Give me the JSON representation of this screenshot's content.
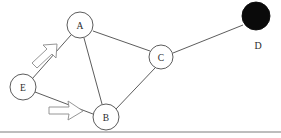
{
  "diagram": {
    "width": 281,
    "height": 138,
    "background_color": "#ffffff",
    "stroke_color": "#4a4a4a",
    "filled_node_color": "#0a0a0a",
    "arrow_outline_color": "#8a8a8a",
    "frame_color": "#6e6e6e"
  },
  "nodes": [
    {
      "id": "A",
      "label": "A",
      "cx": 80,
      "cy": 25,
      "r": 13,
      "style": "open",
      "label_inside": true
    },
    {
      "id": "B",
      "label": "B",
      "cx": 106,
      "cy": 117,
      "r": 13,
      "style": "open",
      "label_inside": true
    },
    {
      "id": "C",
      "label": "C",
      "cx": 161,
      "cy": 57,
      "r": 12,
      "style": "open",
      "label_inside": true
    },
    {
      "id": "D",
      "label": "D",
      "cx": 256,
      "cy": 16,
      "r": 14,
      "style": "filled",
      "label_inside": false,
      "label_x": 258,
      "label_y": 45
    },
    {
      "id": "E",
      "label": "E",
      "cx": 23,
      "cy": 87,
      "r": 13,
      "style": "open",
      "label_inside": true
    }
  ],
  "edges": [
    {
      "from": "E",
      "to": "A",
      "x1": 32,
      "y1": 79,
      "x2": 71,
      "y2": 35
    },
    {
      "from": "E",
      "to": "B",
      "x1": 35,
      "y1": 92,
      "x2": 93,
      "y2": 114
    },
    {
      "from": "A",
      "to": "B",
      "x1": 84,
      "y1": 38,
      "x2": 102,
      "y2": 104
    },
    {
      "from": "A",
      "to": "C",
      "x1": 93,
      "y1": 31,
      "x2": 150,
      "y2": 51
    },
    {
      "from": "B",
      "to": "C",
      "x1": 116,
      "y1": 109,
      "x2": 155,
      "y2": 68
    },
    {
      "from": "C",
      "to": "D",
      "x1": 173,
      "y1": 53,
      "x2": 243,
      "y2": 25
    }
  ],
  "arrows": [
    {
      "id": "arrow-e-to-a",
      "description": "hollow block arrow pointing up-right alongside edge E to A",
      "points": "32,63 47,49 43,45 57,44 56,58 52,54 37,68",
      "direction": "up-right"
    },
    {
      "id": "arrow-e-to-b",
      "description": "hollow block arrow pointing right alongside edge E to B",
      "points": "49,107 69,107 68,102 82,111 68,119 69,114 49,114",
      "direction": "right"
    }
  ],
  "frame": {
    "bottom_rule": {
      "x1": 0,
      "y1": 132,
      "x2": 281,
      "y2": 132
    }
  }
}
